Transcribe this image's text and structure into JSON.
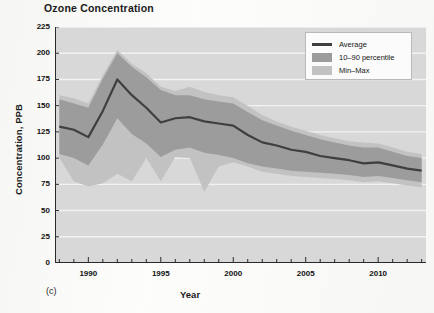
{
  "chart_data": {
    "type": "area",
    "title": "Ozone Concentration",
    "panel_label": "(c)",
    "xlabel": "Year",
    "ylabel": "Concentration, PPB",
    "xlim": [
      1987.7,
      2013.3
    ],
    "ylim": [
      0,
      225
    ],
    "grid": "horizontal-white",
    "legend_position": "top-right",
    "ytick_labels": [
      "225",
      "200",
      "175",
      "150",
      "125",
      "100",
      "75",
      "50",
      "25",
      "0"
    ],
    "ytick_values": [
      225,
      200,
      175,
      150,
      125,
      100,
      75,
      50,
      25,
      0
    ],
    "xtick_labels": [
      "1990",
      "1995",
      "2000",
      "2005",
      "2010"
    ],
    "xtick_values": [
      1990,
      1995,
      2000,
      2005,
      2010
    ],
    "x": [
      1988,
      1989,
      1990,
      1991,
      1992,
      1993,
      1994,
      1995,
      1996,
      1997,
      1998,
      1999,
      2000,
      2001,
      2002,
      2003,
      2004,
      2005,
      2006,
      2007,
      2008,
      2009,
      2010,
      2011,
      2012,
      2013
    ],
    "series": [
      {
        "name": "Average",
        "kind": "line",
        "color": "#3f3f3f",
        "values": [
          130,
          127,
          120,
          145,
          175,
          160,
          148,
          134,
          138,
          139,
          135,
          133,
          131,
          122,
          115,
          112,
          108,
          106,
          102,
          100,
          98,
          95,
          96,
          93,
          90,
          88
        ]
      },
      {
        "name": "10–90 percentile",
        "kind": "band",
        "color": "#9c9c9c",
        "lower": [
          104,
          100,
          93,
          113,
          138,
          123,
          114,
          101,
          108,
          110,
          105,
          103,
          100,
          95,
          92,
          90,
          88,
          87,
          86,
          85,
          84,
          82,
          83,
          81,
          79,
          77
        ],
        "upper": [
          156,
          152,
          148,
          176,
          200,
          187,
          177,
          165,
          160,
          160,
          156,
          154,
          152,
          144,
          136,
          131,
          126,
          122,
          118,
          115,
          112,
          110,
          110,
          106,
          102,
          100
        ]
      },
      {
        "name": "Min–Max",
        "kind": "band",
        "color": "#c2c2c2",
        "lower": [
          100,
          78,
          73,
          76,
          85,
          78,
          100,
          78,
          101,
          100,
          68,
          92,
          96,
          92,
          87,
          85,
          83,
          82,
          81,
          80,
          79,
          77,
          78,
          76,
          74,
          72
        ],
        "upper": [
          160,
          157,
          152,
          179,
          203,
          190,
          181,
          168,
          164,
          168,
          163,
          160,
          158,
          150,
          141,
          135,
          130,
          126,
          122,
          119,
          116,
          115,
          114,
          110,
          106,
          104
        ]
      }
    ],
    "colors": {
      "plot_background": "#d8d8d8",
      "gridline": "#f2f2f2",
      "axis": "#2a2a2a",
      "average_line": "#3f3f3f",
      "percentile_band": "#9c9c9c",
      "minmax_band": "#c2c2c2",
      "legend_background": "#fbfbfb",
      "legend_border": "#b9b9b9"
    }
  },
  "legend": {
    "items": [
      {
        "label": "Average",
        "marker": "line"
      },
      {
        "label": "10–90 percentile",
        "marker": "swatch"
      },
      {
        "label": "Min–Max",
        "marker": "swatch"
      }
    ]
  }
}
